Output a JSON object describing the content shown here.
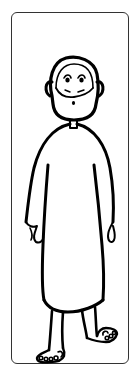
{
  "card": {
    "description": "Line drawing of a bald bearded man in a long robe, barefoot",
    "colors": {
      "stroke": "#000000",
      "border": "#333333",
      "background": "#ffffff"
    }
  }
}
